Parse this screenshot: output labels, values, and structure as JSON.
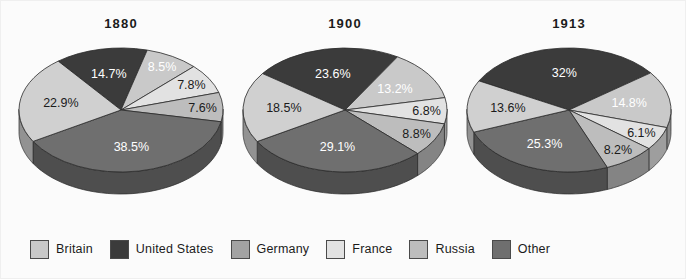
{
  "figure": {
    "background": "#fbfbfb",
    "title": ""
  },
  "legend": {
    "position": "bottom-left",
    "items": [
      {
        "label": "Britain",
        "color": "#c9c9c9"
      },
      {
        "label": "United States",
        "color": "#3b3b3b"
      },
      {
        "label": "Germany",
        "color": "#a3a3a3"
      },
      {
        "label": "France",
        "color": "#e2e2e2"
      },
      {
        "label": "Russia",
        "color": "#bdbdbd"
      },
      {
        "label": "Other",
        "color": "#6f6f6f"
      }
    ]
  },
  "chart_data": [
    {
      "type": "pie",
      "title": "1880",
      "xlabel": "",
      "ylabel": "",
      "categories": [
        "United States",
        "Britain",
        "France",
        "Russia",
        "Germany",
        "Other"
      ],
      "values": [
        14.7,
        8.5,
        7.8,
        7.6,
        38.5,
        22.9
      ],
      "labels": [
        "14.7%",
        "8.5%",
        "7.8%",
        "7.6%",
        "38.5%",
        "22.9%"
      ],
      "colors": [
        "#3b3b3b",
        "#c9c9c9",
        "#e2e2e2",
        "#bdbdbd",
        "#6f6f6f",
        "#d0d0d0"
      ],
      "label_text_colors": [
        "#ffffff",
        "#ffffff",
        "#1b1b1b",
        "#1b1b1b",
        "#ffffff",
        "#1b1b1b"
      ],
      "start_angle_deg": -38,
      "three_d": true
    },
    {
      "type": "pie",
      "title": "1900",
      "xlabel": "",
      "ylabel": "",
      "categories": [
        "United States",
        "Britain",
        "France",
        "Russia",
        "Germany",
        "Other"
      ],
      "values": [
        23.6,
        13.2,
        6.8,
        8.8,
        29.1,
        18.5
      ],
      "labels": [
        "23.6%",
        "13.2%",
        "6.8%",
        "8.8%",
        "29.1%",
        "18.5%"
      ],
      "colors": [
        "#3b3b3b",
        "#c9c9c9",
        "#e2e2e2",
        "#bdbdbd",
        "#6f6f6f",
        "#d0d0d0"
      ],
      "label_text_colors": [
        "#ffffff",
        "#ffffff",
        "#1b1b1b",
        "#1b1b1b",
        "#ffffff",
        "#1b1b1b"
      ],
      "start_angle_deg": -54,
      "three_d": true
    },
    {
      "type": "pie",
      "title": "1913",
      "xlabel": "",
      "ylabel": "",
      "categories": [
        "United States",
        "Britain",
        "France",
        "Russia",
        "Germany",
        "Other"
      ],
      "values": [
        32.0,
        14.8,
        6.1,
        8.2,
        25.3,
        13.6
      ],
      "labels": [
        "32%",
        "14.8%",
        "6.1%",
        "8.2%",
        "25.3%",
        "13.6%"
      ],
      "colors": [
        "#3b3b3b",
        "#c9c9c9",
        "#e2e2e2",
        "#bdbdbd",
        "#6f6f6f",
        "#d0d0d0"
      ],
      "label_text_colors": [
        "#ffffff",
        "#ffffff",
        "#1b1b1b",
        "#1b1b1b",
        "#ffffff",
        "#1b1b1b"
      ],
      "start_angle_deg": -62,
      "three_d": true
    }
  ]
}
